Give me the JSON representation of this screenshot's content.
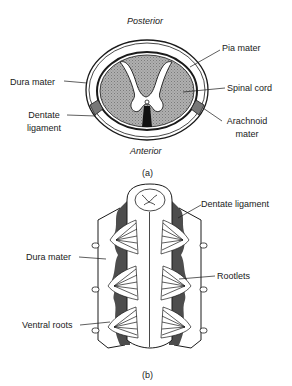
{
  "figure_a": {
    "caption": "(a)",
    "orientation_top": "Posterior",
    "orientation_bottom": "Anterior",
    "labels": {
      "dura_mater": "Dura mater",
      "dentate_ligament_line1": "Dentate",
      "dentate_ligament_line2": "ligament",
      "pia_mater": "Pia mater",
      "spinal_cord": "Spinal cord",
      "arachnoid_line1": "Arachnoid",
      "arachnoid_line2": "mater"
    }
  },
  "figure_b": {
    "caption": "(b)",
    "labels": {
      "dentate_ligament": "Dentate ligament",
      "dura_mater": "Dura mater",
      "rootlets": "Rootlets",
      "ventral_roots": "Ventral roots"
    }
  },
  "colors": {
    "line": "#1a1a1a",
    "fill_gray": "#9a9a9a",
    "fill_dark": "#555555",
    "background": "#ffffff"
  }
}
